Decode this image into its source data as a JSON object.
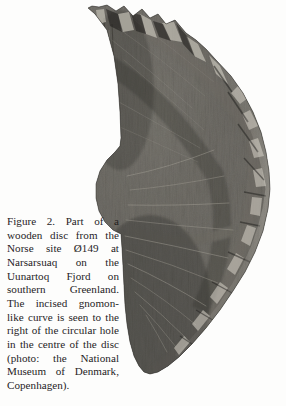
{
  "figure": {
    "kind": "scanned-book-figure",
    "background_color": "#fdfdfc",
    "photo": {
      "name": "wooden-disc-photograph",
      "medium": "black-and-white photograph",
      "subject": "Part of a wooden disc (fragment of a circular disc) with incised gnomon-like curve",
      "shape_description": "quarter/third arc segment of a disc; straight vertical cut edge at upper left, jagged notched top edge, concave circular notch (remains of central hole) at middle left, broad convex arc on the right, tapering to a rounded point at the bottom",
      "colors": {
        "wood_dark": "#3b3a37",
        "wood_mid": "#4d4b47",
        "wood_light": "#6c6a64",
        "highlight": "#b9b5ac",
        "shadow": "#1f1e1c",
        "paper": "#fdfdfc"
      }
    },
    "caption": {
      "label": "Figure 2.",
      "lines": [
        "Figure 2. Part of a",
        "wooden disc from the",
        "Norse site Ø149 at",
        "Narsarsuaq on the",
        "Uunartoq Fjord on",
        "southern Greenland.",
        "The incised gnomon-",
        "like curve is seen to the",
        "right of the circular hole",
        "in the centre of the disc",
        "(photo: the National",
        "Museum of Denmark,",
        "Copenhagen)."
      ],
      "full_text": "Figure 2. Part of a wooden disc from the Norse site Ø149 at Narsarsuaq on the Uunartoq Fjord on southern Greenland. The incised gnomon-like curve is seen to the right of the circular hole in the centre of the disc (photo: the National Museum of Denmark, Copenhagen)."
    }
  }
}
